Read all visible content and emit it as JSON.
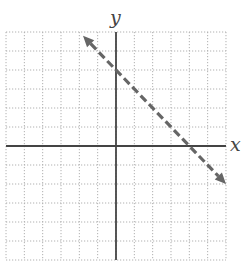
{
  "chart_data": {
    "type": "line",
    "title": "",
    "xlabel": "x",
    "ylabel": "y",
    "xlim": [
      -6,
      6
    ],
    "ylim": [
      -6,
      6
    ],
    "grid": true,
    "grid_style": "dotted",
    "grid_step": 1,
    "tick_labels": false,
    "legend": null,
    "series": [
      {
        "name": "boundary line y = -x + 4",
        "style": "dashed",
        "arrows": "both",
        "equation": "y = -x + 4",
        "slope": -1,
        "y_intercept": 4,
        "x_intercept": 4,
        "x": [
          -1.8,
          6
        ],
        "y": [
          5.8,
          -2
        ]
      }
    ]
  },
  "labels": {
    "x_axis": "x",
    "y_axis": "y"
  },
  "colors": {
    "axis": "#444444",
    "grid": "#b0b0b0",
    "line": "#666666",
    "background": "#ffffff"
  },
  "layout": {
    "origin_px": [
      116,
      146
    ],
    "unit_x_px": 18.33,
    "unit_y_px": 19.0
  }
}
